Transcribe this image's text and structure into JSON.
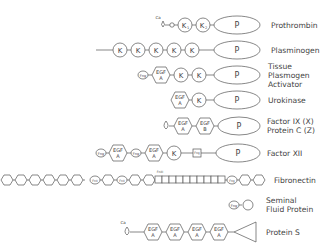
{
  "proteins": [
    {
      "name": "Prothrombin",
      "domains": [
        "Gla",
        "loop",
        "K1",
        "K2",
        "P"
      ]
    },
    {
      "name": "Plasminogen",
      "domains": [
        "tail",
        "K",
        "K",
        "K",
        "K",
        "K",
        "P"
      ]
    },
    {
      "name": "Tissue Plasmogen Activator",
      "name_lines": [
        "Tissue",
        "Plasmogen",
        "Activator"
      ],
      "domains": [
        "Fng",
        "EGF A",
        "K",
        "K",
        "P"
      ]
    },
    {
      "name": "Urokinase",
      "domains": [
        "EGF A",
        "K",
        "P"
      ]
    },
    {
      "name": "Factor IX (X) / Protein C (Z)",
      "name_lines": [
        "Factor IX (X)",
        "Protein C (Z)"
      ],
      "domains": [
        "loop",
        "EGF A",
        "EGF B",
        "P"
      ]
    },
    {
      "name": "Factor XII",
      "domains": [
        "Fng",
        "EGF A",
        "Fng",
        "EGF A",
        "K",
        "Fng",
        "P"
      ]
    },
    {
      "name": "Fibronectin",
      "domains": [
        "hex x8",
        "FnII",
        "hex",
        "FnII",
        "hex x2",
        "FnIII squares",
        "Fng",
        "hex x2"
      ]
    },
    {
      "name": "Seminal Fluid Protein",
      "name_lines": [
        "Seminal",
        "Fluid Protein"
      ],
      "domains": [
        "Fng",
        "circle"
      ]
    },
    {
      "name": "Protein S",
      "domains": [
        "Gla",
        "loop",
        "EGF A",
        "EGF A",
        "EGF A",
        "EGF A",
        "triangle"
      ]
    }
  ],
  "labels": {
    "prothrombin": "Prothrombin",
    "plasminogen": "Plasminogen",
    "tpa1": "Tissue",
    "tpa2": "Plasmogen",
    "tpa3": "Activator",
    "urokinase": "Urokinase",
    "f9a": "Factor IX (X)",
    "f9b": "Protein C (Z)",
    "f12": "Factor XII",
    "fibronectin": "Fibronectin",
    "sfp1": "Seminal",
    "sfp2": "Fluid Protein",
    "proteinS": "Protein S"
  },
  "domain_text": {
    "k": "K",
    "k1": "K",
    "k2": "K",
    "sub1": "1",
    "sub2": "2",
    "p": "P",
    "egf": "EGF",
    "a": "A",
    "b": "B",
    "fng": "Fng",
    "ca": "Ca",
    "fnii": "FnII",
    "fniii": "FnIII"
  }
}
